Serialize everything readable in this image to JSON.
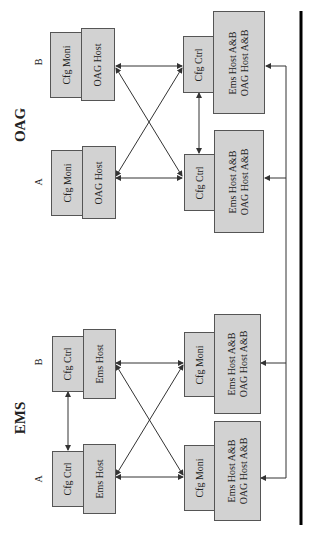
{
  "groups": {
    "oag": {
      "label": "OAG",
      "a": "A",
      "b": "B"
    },
    "ems": {
      "label": "EMS",
      "a": "A",
      "b": "B"
    }
  },
  "nodes": {
    "oag_b_module": "Cfg Moni",
    "oag_b_host": "OAG Host",
    "oag_a_module": "Cfg Moni",
    "oag_a_host": "OAG Host",
    "ems_b_module": "Cfg Ctrl",
    "ems_b_host": "Ems Host",
    "ems_a_module": "Cfg Ctrl",
    "ems_a_host": "Ems Host",
    "r1_module": "Cfg Ctrl",
    "r1_host_line1": "Ems Host A&B",
    "r1_host_line2": "OAG Host A&B",
    "r2_module": "Cfg Ctrl",
    "r2_host_line1": "Ems Host A&B",
    "r2_host_line2": "OAG Host A&B",
    "r3_module": "Cfg Moni",
    "r3_host_line1": "Ems Host A&B",
    "r3_host_line2": "OAG Host A&B",
    "r4_module": "Cfg Moni",
    "r4_host_line1": "Ems Host A&B",
    "r4_host_line2": "OAG Host A&B"
  },
  "colors": {
    "box_fill": "#d2d2d2",
    "border": "#555555",
    "line": "#333333"
  }
}
